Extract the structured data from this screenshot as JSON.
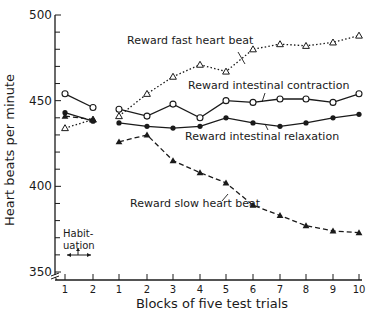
{
  "chart_data": {
    "type": "line",
    "title": "",
    "xlabel": "Blocks of five test trials",
    "ylabel": "Heart beats per minute",
    "ylim": [
      350,
      500
    ],
    "yticks": [
      350,
      400,
      450,
      500
    ],
    "grid": false,
    "legend_position": "inline annotations",
    "habituation": {
      "label_line1": "Habit-",
      "label_line2": "uation",
      "categories": [
        "1",
        "2"
      ]
    },
    "categories": [
      "1",
      "2",
      "3",
      "4",
      "5",
      "6",
      "7",
      "8",
      "9",
      "10"
    ],
    "series": [
      {
        "name": "Reward fast heart beat",
        "marker": "open-triangle",
        "line": "dotted",
        "habituation_values": [
          434,
          439
        ],
        "values": [
          441,
          454,
          464,
          471,
          467,
          480,
          483,
          482,
          484,
          488
        ]
      },
      {
        "name": "Reward intestinal contraction",
        "marker": "open-circle",
        "line": "solid",
        "habituation_values": [
          454,
          446
        ],
        "values": [
          445,
          441,
          448,
          440,
          450,
          449,
          451,
          451,
          449,
          454
        ]
      },
      {
        "name": "Reward intestinal relaxation",
        "marker": "filled-circle",
        "line": "solid",
        "habituation_values": [
          443,
          438
        ],
        "values": [
          437,
          435,
          434,
          435,
          440,
          437,
          435,
          437,
          440,
          442
        ]
      },
      {
        "name": "Reward slow heart beat",
        "marker": "filled-triangle",
        "line": "dashed",
        "habituation_values": [
          441,
          439
        ],
        "values": [
          426,
          430,
          415,
          408,
          402,
          389,
          383,
          377,
          374,
          373
        ]
      }
    ]
  }
}
